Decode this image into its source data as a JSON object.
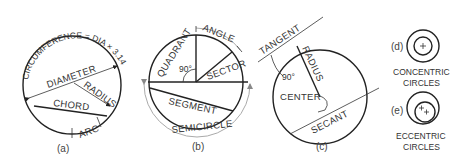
{
  "figure": {
    "panels": [
      {
        "id": "a",
        "caption": "(a)",
        "labels": {
          "circumference": "CIRCUMFERENCE = DIA × 3.1416",
          "diameter": "DIAMETER",
          "radius": "RADIUS",
          "chord": "CHORD",
          "arc": "ARC"
        }
      },
      {
        "id": "b",
        "caption": "(b)",
        "labels": {
          "angle": "ANGLE",
          "quadrant": "QUADRANT",
          "right_angle": "90°",
          "sector": "SECTOR",
          "segment": "SEGMENT",
          "semicircle": "SEMICIRCLE"
        }
      },
      {
        "id": "c",
        "caption": "(c)",
        "labels": {
          "tangent": "TANGENT",
          "radius": "RADIUS",
          "right_angle": "90°",
          "center": "CENTER",
          "secant": "SECANT"
        }
      },
      {
        "id": "d",
        "caption": "(d)",
        "title_line1": "CONCENTRIC",
        "title_line2": "CIRCLES"
      },
      {
        "id": "e",
        "caption": "(e)",
        "title_line1": "ECCENTRIC",
        "title_line2": "CIRCLES"
      }
    ]
  }
}
